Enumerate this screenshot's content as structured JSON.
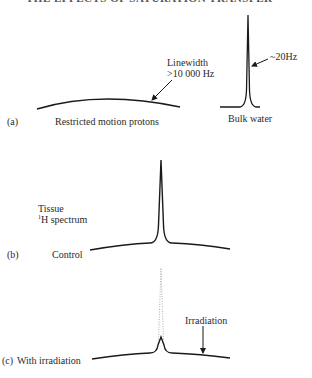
{
  "header": {
    "title_cropped": "THE EFFECTS OF SATURATION TRANSFER"
  },
  "panels": [
    {
      "id": "a",
      "label": "(a)",
      "broad_component": {
        "caption": "Restricted motion protons",
        "annotation_line1": "Linewidth",
        "annotation_line2": ">10 000 Hz"
      },
      "narrow_component": {
        "caption": "Bulk water",
        "annotation": "~20Hz"
      }
    },
    {
      "id": "b",
      "label": "(b)",
      "title_line1": "Tissue",
      "title_line2_sup": "1",
      "title_line2": "H spectrum",
      "caption": "Control"
    },
    {
      "id": "c",
      "label": "(c)",
      "caption": "With irradiation",
      "annotation": "Irradiation"
    }
  ],
  "colors": {
    "line": "#1a1a1a",
    "dotted": "#999999",
    "text": "#2a2a2a"
  }
}
